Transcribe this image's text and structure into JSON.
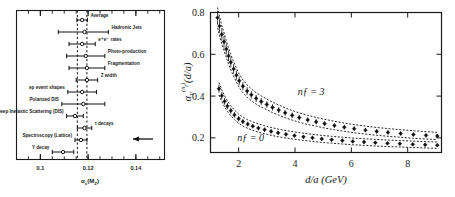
{
  "figure": {
    "title_hidden": "",
    "panels": [
      "alpha-s-world-average",
      "alpha-V-lattice-coupling"
    ]
  },
  "left_panel": {
    "xaxis": {
      "label": "αₛ(Mᴢ)",
      "ticks": [
        "0.1",
        "0.12",
        "0.14"
      ],
      "tick_values": [
        0.1,
        0.12,
        0.14
      ],
      "range": [
        0.09,
        0.152
      ]
    },
    "reference_lines": [
      0.1155,
      0.1195
    ],
    "arrow_note": "left-arrow",
    "measurements": [
      {
        "label": "Average",
        "value": 0.1175,
        "err_low": 0.0022,
        "err_high": 0.0022,
        "label_side": "right"
      },
      {
        "label": "Hadronic Jets",
        "value": 0.1185,
        "err_low": 0.011,
        "err_high": 0.01,
        "label_side": "right"
      },
      {
        "label": "e⁺e⁻ rates",
        "value": 0.1175,
        "err_low": 0.0055,
        "err_high": 0.0055,
        "label_side": "right"
      },
      {
        "label": "Photo-production",
        "value": 0.119,
        "err_low": 0.008,
        "err_high": 0.008,
        "label_side": "right"
      },
      {
        "label": "Fragmentation",
        "value": 0.1195,
        "err_low": 0.0075,
        "err_high": 0.0075,
        "label_side": "right"
      },
      {
        "label": "Z width",
        "value": 0.1195,
        "err_low": 0.0045,
        "err_high": 0.0045,
        "label_side": "right"
      },
      {
        "label": "ep event shapes",
        "value": 0.1175,
        "err_low": 0.006,
        "err_high": 0.006,
        "label_side": "left"
      },
      {
        "label": "Polarized DIS",
        "value": 0.118,
        "err_low": 0.009,
        "err_high": 0.009,
        "label_side": "left"
      },
      {
        "label": "Deep Inelastic Scattering (DIS)",
        "value": 0.1145,
        "err_low": 0.0035,
        "err_high": 0.0035,
        "label_side": "left"
      },
      {
        "label": "τ decays",
        "value": 0.1185,
        "err_low": 0.003,
        "err_high": 0.003,
        "label_side": "right"
      },
      {
        "label": "Spectroscopy (Lattice)",
        "value": 0.117,
        "err_low": 0.0025,
        "err_high": 0.0025,
        "label_side": "left"
      },
      {
        "label": "Υ decay",
        "value": 0.1095,
        "err_low": 0.0045,
        "err_high": 0.0045,
        "label_side": "left"
      }
    ]
  },
  "chart_data": {
    "type": "scatter",
    "title": "",
    "xlabel": "d/a  (GeV)",
    "ylabel": "α_V^(n_f)(d/a)",
    "xlim": [
      1.0,
      9.2
    ],
    "ylim": [
      0.13,
      0.8
    ],
    "xticks": [
      2,
      4,
      6,
      8
    ],
    "yticks": [
      0.2,
      0.4,
      0.6,
      0.8
    ],
    "grid": false,
    "legend_position": "inline-annotations",
    "annotations": [
      {
        "text": "nƒ = 3",
        "x": 4.1,
        "y": 0.405
      },
      {
        "text": "nƒ = 0",
        "x": 1.95,
        "y": 0.185
      }
    ],
    "series": [
      {
        "name": "n_f = 3",
        "x": [
          1.25,
          1.32,
          1.4,
          1.48,
          1.56,
          1.64,
          1.72,
          1.82,
          1.92,
          2.02,
          2.15,
          2.3,
          2.45,
          2.62,
          2.8,
          3.0,
          3.2,
          3.42,
          3.65,
          3.9,
          4.15,
          4.45,
          4.75,
          5.05,
          5.4,
          5.75,
          6.1,
          6.5,
          6.9,
          7.3,
          7.75,
          8.2,
          8.65,
          9.05
        ],
        "y": [
          0.775,
          0.735,
          0.695,
          0.66,
          0.625,
          0.592,
          0.562,
          0.53,
          0.5,
          0.473,
          0.447,
          0.424,
          0.406,
          0.389,
          0.374,
          0.36,
          0.346,
          0.333,
          0.32,
          0.308,
          0.297,
          0.286,
          0.277,
          0.268,
          0.259,
          0.251,
          0.244,
          0.237,
          0.231,
          0.226,
          0.221,
          0.216,
          0.212,
          0.209
        ]
      },
      {
        "name": "n_f = 0",
        "x": [
          1.3,
          1.4,
          1.5,
          1.6,
          1.72,
          1.85,
          2.0,
          2.15,
          2.32,
          2.5,
          2.7,
          2.92,
          3.15,
          3.4,
          3.68,
          3.98,
          4.3,
          4.62,
          4.95,
          5.3,
          5.68,
          6.05,
          6.45,
          6.85,
          7.28,
          7.72,
          8.18,
          8.62,
          9.05
        ],
        "y": [
          0.435,
          0.402,
          0.375,
          0.352,
          0.33,
          0.31,
          0.292,
          0.278,
          0.266,
          0.256,
          0.247,
          0.239,
          0.231,
          0.224,
          0.217,
          0.211,
          0.205,
          0.2,
          0.195,
          0.191,
          0.187,
          0.183,
          0.18,
          0.177,
          0.174,
          0.172,
          0.169,
          0.167,
          0.165
        ]
      }
    ],
    "fit_curves": [
      {
        "name": "fit-upper-nf3",
        "dashed": true
      },
      {
        "name": "fit-lower-nf3",
        "dashed": true
      },
      {
        "name": "fit-upper-nf0",
        "dashed": true
      },
      {
        "name": "fit-lower-nf0",
        "dashed": true
      }
    ]
  }
}
